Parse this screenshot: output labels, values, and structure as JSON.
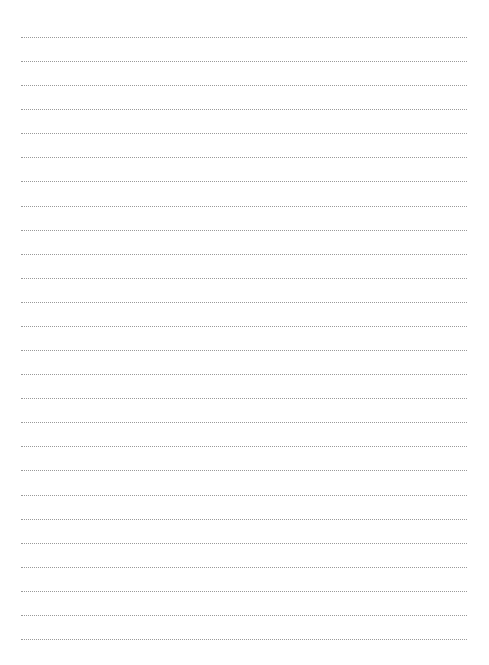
{
  "page": {
    "type": "blank lined writing page",
    "line_style": "dotted",
    "line_color": "#9a9a9a",
    "line_count": 26,
    "first_line_y": 37,
    "line_spacing": 24.08,
    "line_left": 21,
    "line_width": 446
  }
}
